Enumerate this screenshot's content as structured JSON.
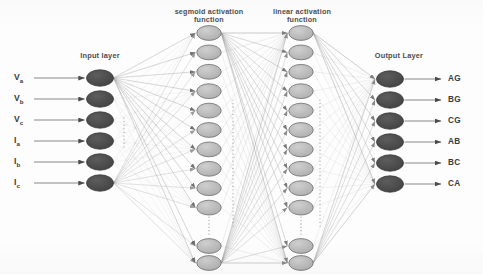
{
  "figure": {
    "type": "neural-network-diagram",
    "title_labels": {
      "input_layer": "Input layer",
      "hidden1": "segmoid activation\nfunction",
      "hidden1_line1": "segmoid activation",
      "hidden1_line2": "function",
      "hidden2_line1": "linear activation",
      "hidden2_line2": "function",
      "output_layer": "Output Layer"
    },
    "colors": {
      "io_node_fill": "#4a4a4a",
      "io_node_stroke": "#3a3a3a",
      "hidden_node_fill": "#b9b9b9",
      "hidden_node_stroke": "#6e6e6e",
      "edge": "#9a9a9a",
      "arrow": "#4a4a4a",
      "text": "#4d4d4d",
      "background": "#fdfdfd"
    }
  },
  "layers": {
    "input": {
      "name": "Input layer",
      "node_count": 6,
      "nodes": [
        {
          "label": "V",
          "sub": "a"
        },
        {
          "label": "V",
          "sub": "b"
        },
        {
          "label": "V",
          "sub": "c"
        },
        {
          "label": "I",
          "sub": "a"
        },
        {
          "label": "I",
          "sub": "b"
        },
        {
          "label": "I",
          "sub": "c"
        }
      ],
      "has_ellipsis": true
    },
    "hidden1": {
      "name": "segmoid activation function",
      "activation": "segmoid",
      "visible_node_count": 12,
      "has_ellipsis": true
    },
    "hidden2": {
      "name": "linear activation function",
      "activation": "linear",
      "visible_node_count": 12,
      "has_ellipsis": true
    },
    "output": {
      "name": "Output Layer",
      "node_count": 6,
      "nodes": [
        "AG",
        "BG",
        "CG",
        "AB",
        "BC",
        "CA"
      ]
    }
  },
  "inputs": [
    {
      "base": "V",
      "sub": "a",
      "full": "Va"
    },
    {
      "base": "V",
      "sub": "b",
      "full": "Vb"
    },
    {
      "base": "V",
      "sub": "c",
      "full": "Vc"
    },
    {
      "base": "I",
      "sub": "a",
      "full": "Ia"
    },
    {
      "base": "I",
      "sub": "b",
      "full": "Ib"
    },
    {
      "base": "I",
      "sub": "c",
      "full": "Ic"
    }
  ],
  "outputs": [
    "AG",
    "BG",
    "CG",
    "AB",
    "BC",
    "CA"
  ]
}
